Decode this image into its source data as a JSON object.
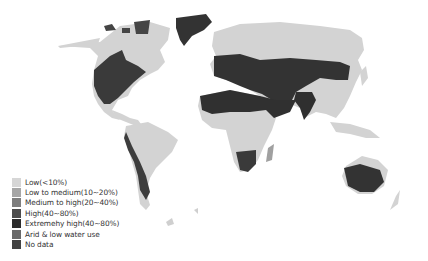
{
  "map": {
    "type": "world choropleth",
    "subject": "water stress levels",
    "colors": {
      "low": "#d3d3d3",
      "low_medium": "#a9a9a9",
      "medium_high": "#808080",
      "high": "#4f4f4f",
      "extremely_high": "#2f2f2f",
      "arid": "#6b6b6b",
      "no_data": "#454545"
    }
  },
  "legend": {
    "items": [
      {
        "label": "Low(<10%)",
        "color": "#d6d6d6"
      },
      {
        "label": "Low to medium(10~20%)",
        "color": "#a6a6a6"
      },
      {
        "label": "Medium to high(20~40%)",
        "color": "#7e7e7e"
      },
      {
        "label": "High(40~80%)",
        "color": "#4c4c4c"
      },
      {
        "label": "Extremehy high(40~80%)",
        "color": "#2c2c2c"
      },
      {
        "label": "Arid & low water use",
        "color": "#696969"
      },
      {
        "label": "No data",
        "color": "#434343"
      }
    ]
  }
}
